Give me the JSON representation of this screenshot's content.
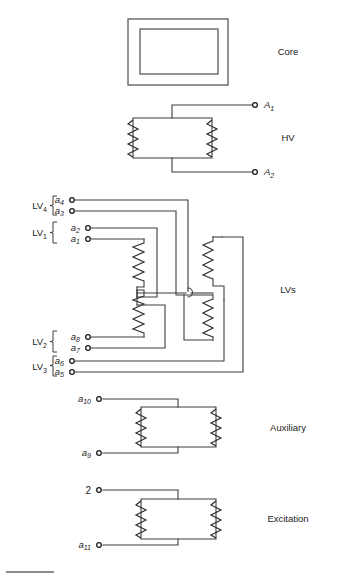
{
  "figure": {
    "width": 338,
    "height": 582,
    "background": "#ffffff",
    "line_color": "#3d3d3d"
  },
  "section_labels": {
    "core": "Core",
    "hv": "HV",
    "lvs": "LVs",
    "auxiliary": "Auxiliary",
    "excitation": "Excitation"
  },
  "hv_terminals": {
    "a1_base": "A",
    "a1_sub": "1",
    "a2_base": "A",
    "a2_sub": "2"
  },
  "lv_groups": [
    {
      "base": "LV",
      "sub": "4"
    },
    {
      "base": "LV",
      "sub": "1"
    },
    {
      "base": "LV",
      "sub": "2"
    },
    {
      "base": "LV",
      "sub": "3"
    }
  ],
  "lv_terminals": [
    {
      "base": "a",
      "sub": "4"
    },
    {
      "base": "a",
      "sub": "3"
    },
    {
      "base": "a",
      "sub": "2"
    },
    {
      "base": "a",
      "sub": "1"
    },
    {
      "base": "a",
      "sub": "8"
    },
    {
      "base": "a",
      "sub": "7"
    },
    {
      "base": "a",
      "sub": "6"
    },
    {
      "base": "a",
      "sub": "5"
    }
  ],
  "auxiliary_terminals": [
    {
      "base": "a",
      "sub": "10"
    },
    {
      "base": "a",
      "sub": "9"
    }
  ],
  "excitation_terminals": [
    {
      "base": "2",
      "sub": ""
    },
    {
      "base": "a",
      "sub": "11"
    }
  ]
}
